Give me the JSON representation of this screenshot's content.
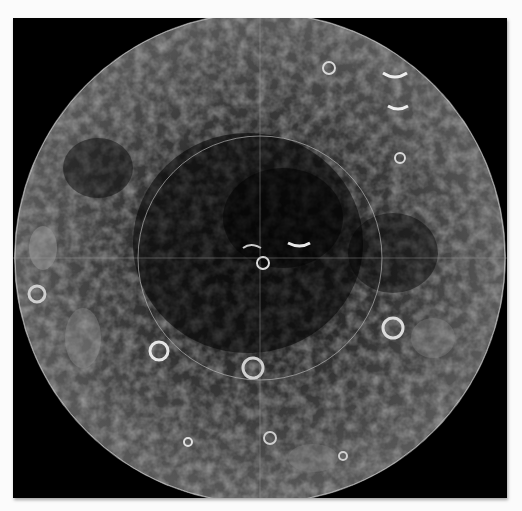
{
  "image": {
    "subject": "Lunar south pole mosaic",
    "background_color": "#000000",
    "frame_color": "#fbfbfb",
    "surface_tones": [
      "#2a2a2a",
      "#4a4a4a",
      "#777777",
      "#bdbdbd",
      "#eeeeee"
    ],
    "overlays": {
      "outer_circle": true,
      "inner_circle": true,
      "crosshair": true
    }
  }
}
